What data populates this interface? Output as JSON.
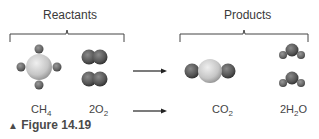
{
  "figure": {
    "caption_marker": "▲",
    "caption": "Figure 14.19"
  },
  "groups": {
    "reactants_label": "Reactants",
    "products_label": "Products"
  },
  "molecules": {
    "ch4": {
      "base": "CH",
      "sub": "4",
      "coef": ""
    },
    "o2": {
      "coef": "2O",
      "sub": "2",
      "rest": ""
    },
    "co2": {
      "base": "CO",
      "sub": "2"
    },
    "h2o": {
      "coef": "2H",
      "sub": "2",
      "rest": "O"
    }
  },
  "colors": {
    "carbon": "#c8c8c8",
    "oxygen": "#555555",
    "hydrogen": "#6a6a6a",
    "bracket": "#444444"
  }
}
